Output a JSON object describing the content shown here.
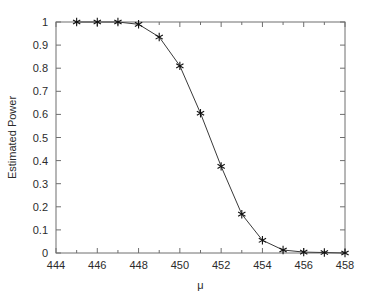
{
  "chart_data": {
    "type": "line",
    "title": "",
    "xlabel": "μ",
    "ylabel": "Estimated Power",
    "xlim": [
      444,
      458
    ],
    "ylim": [
      0,
      1
    ],
    "xticks": [
      444,
      446,
      448,
      450,
      452,
      454,
      456,
      458
    ],
    "xtick_labels": [
      "444",
      "446",
      "448",
      "450",
      "452",
      "454",
      "456",
      "458"
    ],
    "xminor_ticks": [
      445,
      447,
      449,
      451,
      453,
      455,
      457
    ],
    "yticks": [
      0,
      0.1,
      0.2,
      0.3,
      0.4,
      0.5,
      0.6,
      0.7,
      0.8,
      0.9,
      1
    ],
    "ytick_labels": [
      "0",
      "0.1",
      "0.2",
      "0.3",
      "0.4",
      "0.5",
      "0.6",
      "0.7",
      "0.8",
      "0.9",
      "1"
    ],
    "grid": false,
    "legend": null,
    "marker": "asterisk",
    "line_color": "#3a3a3a",
    "marker_color": "#111111",
    "x": [
      445,
      446,
      447,
      448,
      449,
      450,
      451,
      452,
      453,
      454,
      455,
      456,
      457,
      458
    ],
    "values": [
      1.0,
      1.0,
      1.0,
      0.99,
      0.935,
      0.81,
      0.605,
      0.375,
      0.168,
      0.055,
      0.013,
      0.004,
      0.002,
      0.0
    ],
    "series": [
      {
        "name": "Estimated Power",
        "x": [
          445,
          446,
          447,
          448,
          449,
          450,
          451,
          452,
          453,
          454,
          455,
          456,
          457,
          458
        ],
        "values": [
          1.0,
          1.0,
          1.0,
          0.99,
          0.935,
          0.81,
          0.605,
          0.375,
          0.168,
          0.055,
          0.013,
          0.004,
          0.002,
          0.0
        ]
      }
    ]
  }
}
